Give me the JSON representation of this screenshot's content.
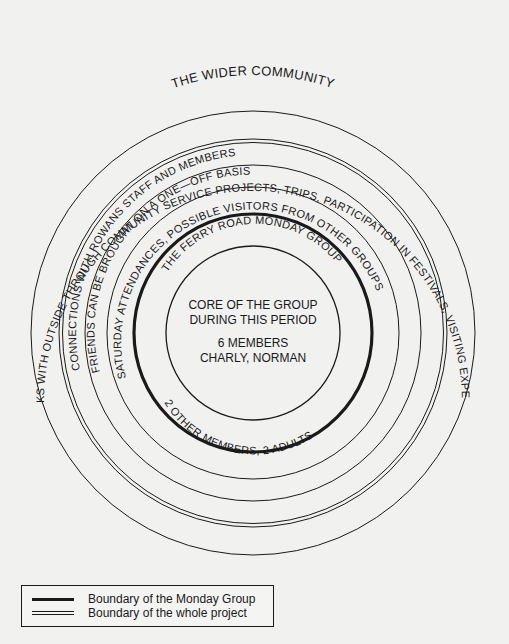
{
  "diagram": {
    "center": {
      "x": 253,
      "y": 333
    },
    "ring_color": "#1a1a1a",
    "rings": [
      {
        "name": "outer-boundary",
        "radius": 222,
        "style": "single"
      },
      {
        "name": "whole-project-boundary",
        "radius": 193,
        "style": "double"
      },
      {
        "name": "rowans-ring",
        "radius": 168,
        "style": "single"
      },
      {
        "name": "friends-ring",
        "radius": 146,
        "style": "single"
      },
      {
        "name": "monday-group-boundary",
        "radius": 119,
        "style": "thick"
      },
      {
        "name": "core-boundary",
        "radius": 87,
        "style": "single"
      }
    ],
    "labels": {
      "wider_community": "THE WIDER COMMUNITY",
      "links_outside": "LINKS WITH OUTSIDE THROUGH COMMUNITY SERVICE PROJECTS, TRIPS, PARTICIPATION IN FESTIVALS, VISITING EXPERTS",
      "connections_rowans": "CONNECTIONS WITH ROWANS STAFF AND MEMBERS",
      "friends": "FRIENDS CAN BE BROUGHT ON A ONE—OFF BASIS",
      "saturday": "SATURDAY ATTENDANCES, POSSIBLE VISITORS FROM OTHER GROUPS",
      "ferry_road": "THE FERRY ROAD MONDAY GROUP",
      "other_members": "2 OTHER MEMBERS, 2 ADULTS"
    },
    "core": {
      "line1": "CORE OF THE GROUP",
      "line2": "DURING THIS PERIOD",
      "line3": "6 MEMBERS",
      "line4": "CHARLY, NORMAN"
    }
  },
  "legend": {
    "items": [
      {
        "label": "Boundary of the Monday Group",
        "style": "thick"
      },
      {
        "label": "Boundary of the whole project",
        "style": "double"
      }
    ]
  }
}
